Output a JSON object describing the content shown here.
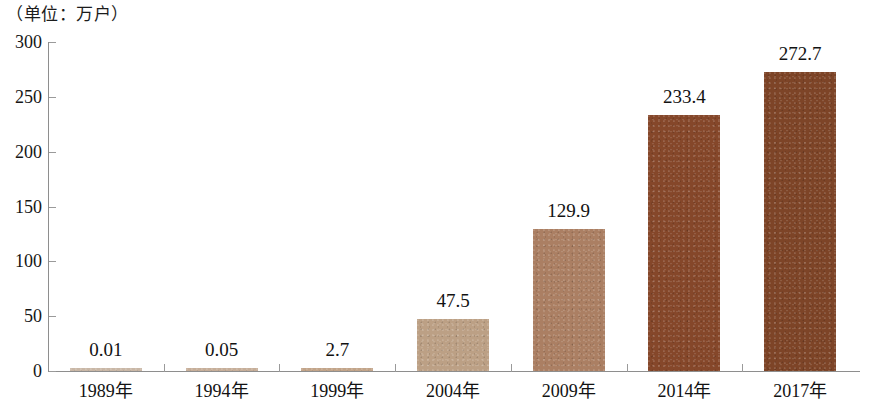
{
  "caption": "（单位：万户）",
  "chart_data": {
    "type": "bar",
    "title": "（单位：万户）",
    "xlabel": "",
    "ylabel": "",
    "unit": "万户",
    "ylim": [
      0,
      300
    ],
    "yticks": [
      0,
      50,
      100,
      150,
      200,
      250,
      300
    ],
    "ytick_labels": [
      "0",
      "50",
      "100",
      "150",
      "200",
      "250",
      "300"
    ],
    "grid": false,
    "legend": false,
    "categories": [
      "1989年",
      "1994年",
      "1999年",
      "2004年",
      "2009年",
      "2014年",
      "2017年"
    ],
    "values": [
      0.01,
      0.05,
      2.7,
      47.5,
      129.9,
      233.4,
      272.7
    ],
    "value_labels": [
      "0.01",
      "0.05",
      "2.7",
      "47.5",
      "129.9",
      "233.4",
      "272.7"
    ],
    "bar_colors": [
      "#c9b7a6",
      "#c6ae99",
      "#c2a489",
      "#bca085",
      "#ab7f63",
      "#85472a",
      "#7d4427"
    ]
  }
}
